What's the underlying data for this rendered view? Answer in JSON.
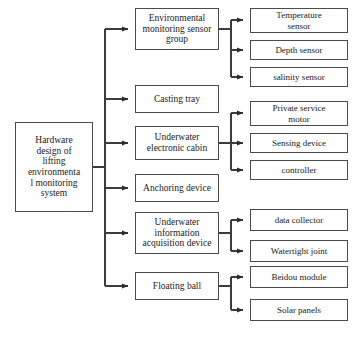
{
  "diagram": {
    "type": "hierarchical-tree",
    "orientation": "left-to-right",
    "levels": 3,
    "colors": {
      "box_border": "#4a4a4a",
      "connector": "#3c3c3c",
      "background": "#ffffff",
      "text": "#1a1a1a"
    },
    "caption": "",
    "root": {
      "id": "root",
      "label": "Hardware design of lifting environmenta l monitoring system",
      "lines": [
        "Hardware",
        "design of",
        "lifting",
        "environmenta",
        "l monitoring",
        "system"
      ],
      "x": 15,
      "y": 122,
      "w": 78,
      "h": 90
    },
    "branches": [
      {
        "id": "environmental-monitoring-sensor-group",
        "label": "Environmental monitoring sensor group",
        "lines": [
          "Environmental",
          "monitoring sensor",
          "group"
        ],
        "x": 135,
        "y": 8,
        "w": 84,
        "h": 42,
        "children": [
          {
            "id": "temperature-sensor",
            "label": "Temperature sensor",
            "lines": [
              "Temperature",
              "sensor"
            ],
            "x": 250,
            "y": 8,
            "w": 98,
            "h": 25
          },
          {
            "id": "depth-sensor",
            "label": "Depth sensor",
            "lines": [
              "Depth sensor"
            ],
            "x": 250,
            "y": 40,
            "w": 98,
            "h": 20
          },
          {
            "id": "salinity-sensor",
            "label": "salinity sensor",
            "lines": [
              "salinity sensor"
            ],
            "x": 250,
            "y": 67,
            "w": 98,
            "h": 20
          }
        ]
      },
      {
        "id": "casting-tray",
        "label": "Casting tray",
        "lines": [
          "Casting tray"
        ],
        "x": 135,
        "y": 85,
        "w": 84,
        "h": 28,
        "children": []
      },
      {
        "id": "underwater-electronic-cabin",
        "label": "Underwater electronic cabin",
        "lines": [
          "Underwater",
          "electronic cabin"
        ],
        "x": 135,
        "y": 126,
        "w": 84,
        "h": 34,
        "children": [
          {
            "id": "private-service-motor",
            "label": "Private service motor",
            "lines": [
              "Private service",
              "motor"
            ],
            "x": 250,
            "y": 101,
            "w": 98,
            "h": 25
          },
          {
            "id": "sensing-device",
            "label": "Sensing device",
            "lines": [
              "Sensing device"
            ],
            "x": 250,
            "y": 133,
            "w": 98,
            "h": 20
          },
          {
            "id": "controller",
            "label": "controller",
            "lines": [
              "controller"
            ],
            "x": 250,
            "y": 160,
            "w": 98,
            "h": 20
          }
        ]
      },
      {
        "id": "anchoring-device",
        "label": "Anchoring device",
        "lines": [
          "Anchoring device"
        ],
        "x": 135,
        "y": 174,
        "w": 84,
        "h": 28,
        "children": []
      },
      {
        "id": "underwater-information-acquisition-device",
        "label": "Underwater information acquisition device",
        "lines": [
          "Underwater",
          "information",
          "acquisition device"
        ],
        "x": 135,
        "y": 212,
        "w": 84,
        "h": 42,
        "children": [
          {
            "id": "data-collector",
            "label": "data collector",
            "lines": [
              "data collector"
            ],
            "x": 250,
            "y": 209,
            "w": 98,
            "h": 22
          },
          {
            "id": "watertight-joint",
            "label": "Watertight joint",
            "lines": [
              "Watertight joint"
            ],
            "x": 250,
            "y": 240,
            "w": 98,
            "h": 22
          }
        ]
      },
      {
        "id": "floating-ball",
        "label": "Floating ball",
        "lines": [
          "Floating ball"
        ],
        "x": 135,
        "y": 272,
        "w": 84,
        "h": 28,
        "children": [
          {
            "id": "beidou-module",
            "label": "Beidou module",
            "lines": [
              "Beidou module"
            ],
            "x": 250,
            "y": 266,
            "w": 98,
            "h": 22
          },
          {
            "id": "solar-panels",
            "label": "Solar panels",
            "lines": [
              "Solar panels"
            ],
            "x": 250,
            "y": 299,
            "w": 98,
            "h": 22
          }
        ]
      }
    ]
  }
}
